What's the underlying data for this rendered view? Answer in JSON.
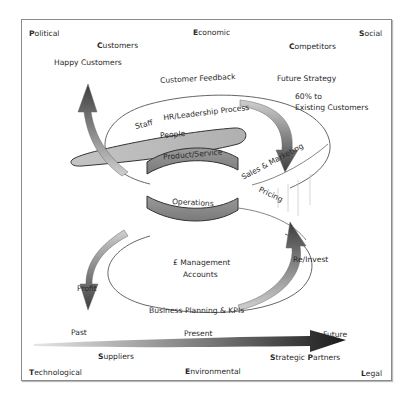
{
  "pestle": {
    "political": {
      "initial": "P",
      "rest": "olitical"
    },
    "economic": {
      "initial": "E",
      "rest": "conomic"
    },
    "social": {
      "initial": "S",
      "rest": "ocial"
    },
    "technological": {
      "initial": "T",
      "rest": "echnological"
    },
    "environmental": {
      "initial": "E",
      "rest": "nvironmental"
    },
    "legal": {
      "initial": "L",
      "rest": "egal"
    }
  },
  "stakeholders": {
    "customers": {
      "initial": "C",
      "rest": "ustomers"
    },
    "competitors": {
      "initial": "C",
      "rest": "ompetitors"
    },
    "suppliers": {
      "initial": "S",
      "rest": "uppliers"
    },
    "strategic_partners": {
      "initial1": "S",
      "rest1": "trategic ",
      "initial2": "P",
      "rest2": "artners"
    }
  },
  "labels": {
    "happy_customers": "Happy Customers",
    "customer_feedback": "Customer Feedback",
    "future_strategy": "Future Strategy",
    "existing_line1": "60% to",
    "existing_line2": "Existing Customers",
    "staff": "Staff",
    "hr_leadership": "HR/Leadership Process",
    "people": "People",
    "product_service": "Product/Service",
    "sales_marketing": "Sales & Marketing",
    "operations": "Operations",
    "pricing": "Pricing",
    "management_line1": "£ Management",
    "management_line2": "Accounts",
    "re_invest": "Re/Invest",
    "profit": "Profit",
    "business_planning": "Business Planning & KPIs",
    "past": "Past",
    "present": "Present",
    "future": "Future"
  },
  "colors": {
    "frame": "#8a8a8a",
    "arrow_dark": "#3a3a3a",
    "arrow_mid": "#8c8c8c",
    "band_fill": "#a8a8a8",
    "ellipse_stroke": "#555555"
  }
}
